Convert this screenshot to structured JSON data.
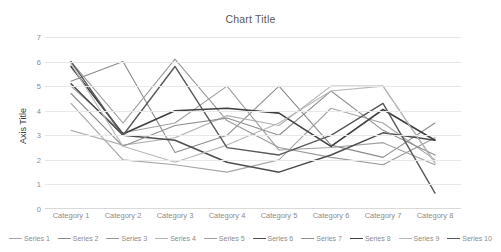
{
  "chart_data": {
    "type": "line",
    "title": "Chart Title",
    "xlabel": "",
    "ylabel": "Axis Title",
    "ylim": [
      0,
      7
    ],
    "yticks": [
      0,
      1,
      2,
      3,
      4,
      5,
      6,
      7
    ],
    "grid": true,
    "legend_position": "bottom",
    "categories": [
      "Category 1",
      "Category 2",
      "Category 3",
      "Category 4",
      "Category 5",
      "Category 6",
      "Category 7",
      "Category 8"
    ],
    "series": [
      {
        "name": "Series 1",
        "color": "#a6a6a6",
        "width": 1.1,
        "values": [
          4.3,
          2.0,
          1.8,
          1.5,
          2.0,
          4.1,
          3.5,
          2.0
        ]
      },
      {
        "name": "Series 2",
        "color": "#8c8c8c",
        "width": 1.1,
        "values": [
          5.2,
          6.0,
          2.3,
          3.0,
          5.0,
          2.6,
          2.1,
          3.5
        ]
      },
      {
        "name": "Series 3",
        "color": "#999999",
        "width": 1.1,
        "values": [
          6.0,
          3.5,
          6.1,
          3.6,
          2.5,
          2.1,
          1.8,
          2.9
        ]
      },
      {
        "name": "Series 4",
        "color": "#b3b3b3",
        "width": 1.1,
        "values": [
          3.2,
          2.6,
          2.9,
          3.8,
          3.4,
          5.0,
          5.0,
          1.9
        ]
      },
      {
        "name": "Series 5",
        "color": "#a0a0a0",
        "width": 1.1,
        "values": [
          5.0,
          3.1,
          3.5,
          5.0,
          2.4,
          2.5,
          2.7,
          1.8
        ]
      },
      {
        "name": "Series 6",
        "color": "#4d4d4d",
        "width": 1.5,
        "values": [
          5.1,
          3.0,
          2.8,
          1.9,
          1.5,
          2.2,
          3.1,
          2.8
        ]
      },
      {
        "name": "Series 7",
        "color": "#8f8f8f",
        "width": 1.1,
        "values": [
          4.7,
          2.55,
          3.4,
          3.7,
          3.0,
          4.8,
          3.2,
          2.2
        ]
      },
      {
        "name": "Series 8",
        "color": "#404040",
        "width": 1.6,
        "values": [
          5.8,
          3.05,
          4.0,
          4.1,
          3.9,
          2.55,
          4.05,
          2.8
        ]
      },
      {
        "name": "Series 9",
        "color": "#b8b8b8",
        "width": 1.1,
        "values": [
          5.9,
          2.55,
          1.9,
          2.6,
          3.5,
          4.8,
          5.0,
          1.85
        ]
      },
      {
        "name": "Series 10",
        "color": "#595959",
        "width": 1.4,
        "values": [
          6.0,
          3.0,
          5.8,
          2.5,
          2.2,
          3.0,
          4.3,
          0.65
        ]
      }
    ]
  }
}
